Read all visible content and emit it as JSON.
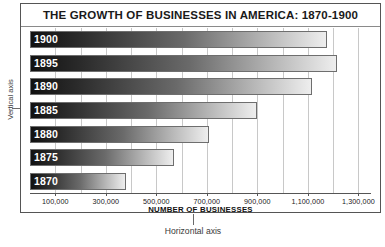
{
  "chart_data": {
    "type": "bar",
    "orientation": "horizontal",
    "title": "THE GROWTH OF BUSINESSES IN AMERICA: 1870-1900",
    "xlabel": "NUMBER OF BUSINESSES",
    "ylabel": "",
    "categories": [
      "1900",
      "1895",
      "1890",
      "1885",
      "1880",
      "1875",
      "1870"
    ],
    "values": [
      1175000,
      1215000,
      1115000,
      900000,
      710000,
      570000,
      380000
    ],
    "xlim": [
      0,
      1350000
    ],
    "xticks": [
      100000,
      300000,
      500000,
      700000,
      900000,
      1100000,
      1300000
    ],
    "xticklabels": [
      "100,000",
      "300,000",
      "500,000",
      "700,000",
      "900,000",
      "1,100,000",
      "1,300,000"
    ],
    "gridlines": [
      100000,
      200000,
      300000,
      400000,
      500000,
      600000,
      700000,
      800000,
      900000,
      1000000,
      1100000,
      1200000,
      1300000
    ],
    "grid": true,
    "legend": false,
    "bar_style": "gradient-dark-to-light",
    "annotations": [
      {
        "text": "Vertical axis",
        "target": "y-axis"
      },
      {
        "text": "Horizontal axis",
        "target": "x-axis"
      }
    ]
  },
  "colors": {
    "frame": "#555555",
    "gridline": "#c8c8c8",
    "bar_dark": "#111111",
    "bar_light": "#eeeeee",
    "bar_border": "#6e6e6e",
    "title_text": "#1a1a1a",
    "annotation_text": "#3a3a3a",
    "background": "#ffffff"
  },
  "annotations": {
    "vertical_axis": "Vertical axis",
    "horizontal_axis": "Horizontal axis"
  }
}
